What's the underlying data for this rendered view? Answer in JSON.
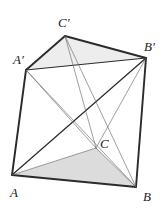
{
  "figure": {
    "type": "geometry-diagram",
    "width": 165,
    "height": 211,
    "background_color": "#ffffff",
    "stroke_color": "#2b2b2b",
    "thin_stroke_color": "#6b6b6b",
    "shade_bottom_color": "#dcdcdc",
    "shade_top_color": "#ededed",
    "vertices": [
      {
        "name": "A",
        "label": "A",
        "x": 12,
        "y": 175,
        "label_x": 10,
        "label_y": 186
      },
      {
        "name": "B",
        "label": "B",
        "x": 136,
        "y": 187,
        "label_x": 143,
        "label_y": 190
      },
      {
        "name": "C",
        "label": "C",
        "x": 96,
        "y": 148,
        "label_x": 100,
        "label_y": 137
      },
      {
        "name": "Ap",
        "label": "A",
        "prime": "′",
        "x": 26,
        "y": 70,
        "label_x": 13,
        "label_y": 53
      },
      {
        "name": "Bp",
        "label": "B",
        "prime": "′",
        "x": 146,
        "y": 58,
        "label_x": 144,
        "label_y": 40
      },
      {
        "name": "Cp",
        "label": "C",
        "prime": "′",
        "x": 65,
        "y": 36,
        "label_x": 58,
        "label_y": 16
      }
    ],
    "faces": [
      {
        "name": "bottom-triangle-ABC",
        "points": "12,175 136,187 96,148",
        "fill": "#dcdcdc"
      },
      {
        "name": "top-triangle-ApBpCp",
        "points": "26,70 146,58 65,36",
        "fill": "#ededed"
      }
    ],
    "edges": [
      {
        "name": "edge-A-B",
        "x1": 12,
        "y1": 175,
        "x2": 136,
        "y2": 187,
        "weight": "thick"
      },
      {
        "name": "edge-A-Ap",
        "x1": 12,
        "y1": 175,
        "x2": 26,
        "y2": 70,
        "weight": "thick"
      },
      {
        "name": "edge-Ap-Cp",
        "x1": 26,
        "y1": 70,
        "x2": 65,
        "y2": 36,
        "weight": "thick"
      },
      {
        "name": "edge-Cp-Bp",
        "x1": 65,
        "y1": 36,
        "x2": 146,
        "y2": 58,
        "weight": "thick"
      },
      {
        "name": "edge-Bp-B",
        "x1": 146,
        "y1": 58,
        "x2": 136,
        "y2": 187,
        "weight": "thick"
      },
      {
        "name": "edge-Ap-Bp",
        "x1": 26,
        "y1": 70,
        "x2": 146,
        "y2": 58,
        "weight": "medium"
      },
      {
        "name": "diagonal-A-Bp",
        "x1": 12,
        "y1": 175,
        "x2": 146,
        "y2": 58,
        "weight": "medium"
      },
      {
        "name": "edge-A-C",
        "x1": 12,
        "y1": 175,
        "x2": 96,
        "y2": 148,
        "weight": "thin"
      },
      {
        "name": "edge-C-B",
        "x1": 96,
        "y1": 148,
        "x2": 136,
        "y2": 187,
        "weight": "thin"
      },
      {
        "name": "diagonal-Ap-B",
        "x1": 26,
        "y1": 70,
        "x2": 136,
        "y2": 187,
        "weight": "thin"
      },
      {
        "name": "diagonal-Cp-C",
        "x1": 65,
        "y1": 36,
        "x2": 96,
        "y2": 148,
        "weight": "thin"
      },
      {
        "name": "diagonal-Cp-B",
        "x1": 65,
        "y1": 36,
        "x2": 136,
        "y2": 187,
        "weight": "thin"
      },
      {
        "name": "diagonal-Ap-C",
        "x1": 26,
        "y1": 70,
        "x2": 96,
        "y2": 148,
        "weight": "thin"
      },
      {
        "name": "diagonal-Bp-C",
        "x1": 146,
        "y1": 58,
        "x2": 96,
        "y2": 148,
        "weight": "thin"
      }
    ]
  }
}
